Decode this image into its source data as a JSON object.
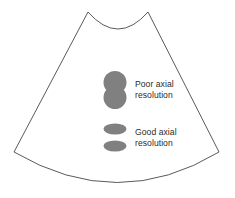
{
  "figure": {
    "name": "ultrasound-sector-axial-resolution-diagram",
    "background_color": "#ffffff",
    "outline_color": "#5a5a5a",
    "marker_color": "#808080",
    "text_color": "#2b2b2b"
  },
  "sector": {
    "name": "ultrasound-sector-scan-field",
    "apex_left_x": 88,
    "apex_right_x": 148,
    "apex_y": 12,
    "top_arc_dip_y": 33,
    "bottom_left_x": 14,
    "bottom_right_x": 219,
    "bottom_corner_y": 152,
    "bottom_arc_dip_y": 190
  },
  "annotations": [
    {
      "id": "poor-axial-resolution",
      "marker_type": "overlapping-circles",
      "label": "Poor axial\nresolution",
      "label_line1": "Poor axial",
      "label_line2": "resolution"
    },
    {
      "id": "good-axial-resolution",
      "marker_type": "separated-ellipses",
      "label": "Good axial\nresolution",
      "label_line1": "Good axial",
      "label_line2": "resolution"
    }
  ]
}
